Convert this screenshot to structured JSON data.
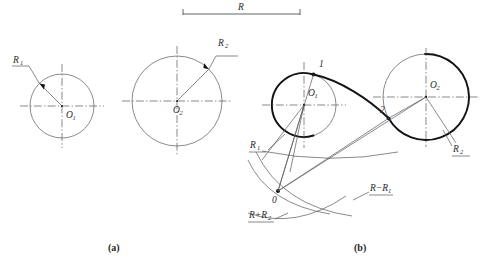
{
  "figure": {
    "title_a": "(a)",
    "title_b": "(b)",
    "dimension_top": {
      "label": "R"
    },
    "panel_a": {
      "circle1": {
        "center_label": "O",
        "center_sub": "1",
        "radius_label": "R",
        "radius_sub": "1"
      },
      "circle2": {
        "center_label": "O",
        "center_sub": "2",
        "radius_label": "R",
        "radius_sub": "2"
      }
    },
    "panel_b": {
      "circle1": {
        "center_label": "O",
        "center_sub": "1",
        "radius_label": "R",
        "radius_sub": "1"
      },
      "circle2": {
        "center_label": "O",
        "center_sub": "2",
        "radius_label": "R",
        "radius_sub": "2"
      },
      "tangent_point_1": "1",
      "tangent_point_2": "2",
      "arc_center_point": "0",
      "construction_label_minus": "R−R",
      "construction_label_minus_sub": "1",
      "construction_label_plus": "R+R",
      "construction_label_plus_sub": "2"
    }
  },
  "colors": {
    "thin_line": "#54585c",
    "thick_line": "#111316",
    "text": "#2b2b2b",
    "background": "#ffffff"
  }
}
